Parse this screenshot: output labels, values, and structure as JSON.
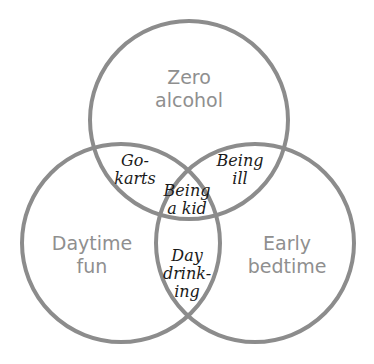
{
  "diagram": {
    "type": "venn",
    "stroke_color": "#8c8c8c",
    "sets": [
      {
        "id": "top",
        "label": "Zero\nalcohol",
        "cx": 189,
        "cy": 120,
        "r": 100
      },
      {
        "id": "left",
        "label": "Daytime\nfun",
        "cx": 122,
        "cy": 243,
        "r": 100
      },
      {
        "id": "right",
        "label": "Early\nbedtime",
        "cx": 254,
        "cy": 243,
        "r": 100
      }
    ],
    "intersections": [
      {
        "sets": [
          "top",
          "left"
        ],
        "label": "Go-\nkarts"
      },
      {
        "sets": [
          "top",
          "right"
        ],
        "label": "Being\nill"
      },
      {
        "sets": [
          "top",
          "left",
          "right"
        ],
        "label": "Being\na kid"
      },
      {
        "sets": [
          "left",
          "right"
        ],
        "label": "Day\ndrink-\ning"
      }
    ]
  }
}
